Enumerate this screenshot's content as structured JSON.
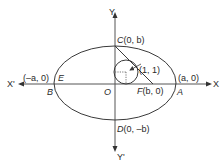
{
  "diagram": {
    "type": "ellipse-with-inscribed-circle",
    "colors": {
      "stroke": "#3a3a3a",
      "axis": "#555555",
      "text": "#2a2a2a",
      "background": "#ffffff"
    },
    "axes": {
      "x_pos": "X",
      "x_neg": "X'",
      "y_pos": "Y",
      "y_neg": "Y'"
    },
    "origin": "O",
    "points": {
      "A": {
        "name": "A",
        "coord": "(a, 0)"
      },
      "B": {
        "name": "B"
      },
      "E": {
        "name": "E",
        "coord": "(–a, 0)"
      },
      "C": {
        "name": "C",
        "coord": "(0, b)",
        "full": "C(0, b)"
      },
      "D": {
        "name": "D",
        "coord": "(0, –b)",
        "full": "D(0, –b)"
      },
      "F": {
        "name": "F",
        "coord": "(b, 0)",
        "full": "F(b, 0)"
      },
      "circle_center": {
        "coord": "(1, 1)"
      }
    }
  }
}
